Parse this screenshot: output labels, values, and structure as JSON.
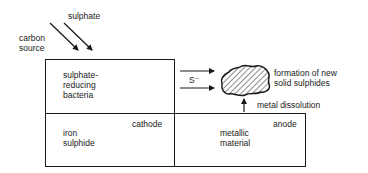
{
  "diagram": {
    "inputs": {
      "sulphate": "sulphate",
      "carbon_source_line1": "carbon",
      "carbon_source_line2": "source"
    },
    "bacteria_box": {
      "line1": "sulphate-",
      "line2": "reducing",
      "line3": "bacteria"
    },
    "sulphide_ion": "S⁻",
    "precipitate": {
      "line1": "formation of new",
      "line2": "solid sulphides"
    },
    "metal_dissolution": "metal dissolution",
    "cathode_box": {
      "tag": "cathode",
      "line1": "iron",
      "line2": "sulphide"
    },
    "anode_box": {
      "tag": "anode",
      "line1": "metallic",
      "line2": "material"
    }
  }
}
